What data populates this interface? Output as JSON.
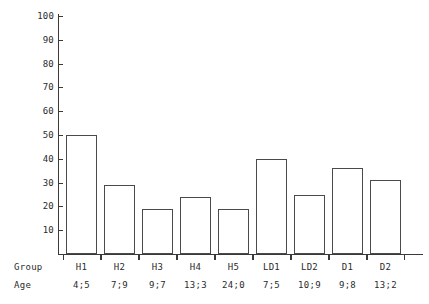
{
  "chart_data": {
    "type": "bar",
    "title": "",
    "subtitle": "",
    "xlabel": "",
    "ylabel": "",
    "categories": [
      "H1",
      "H2",
      "H3",
      "H4",
      "H5",
      "LD1",
      "LD2",
      "D1",
      "D2"
    ],
    "values": [
      50,
      29,
      19,
      24,
      19,
      40,
      25,
      36,
      31
    ],
    "ylim": [
      0,
      100
    ],
    "ytick_labels": [
      "100",
      "90",
      "80",
      "70",
      "60",
      "50",
      "40",
      "30",
      "20",
      "10"
    ],
    "ytick_values": [
      100,
      90,
      80,
      70,
      60,
      50,
      40,
      30,
      20,
      10
    ],
    "grid": false,
    "legend": "none",
    "bar_fill": "#ffffff",
    "bar_edge": "#4a4a4a",
    "axis_color": "#3a3a3a",
    "background": "#ffffff",
    "row_headers": {
      "group": "Group",
      "age": "Age"
    },
    "rows": [
      {
        "group": "H1",
        "age": "4;5",
        "value": 50
      },
      {
        "group": "H2",
        "age": "7;9",
        "value": 29
      },
      {
        "group": "H3",
        "age": "9;7",
        "value": 19
      },
      {
        "group": "H4",
        "age": "13;3",
        "value": 24
      },
      {
        "group": "H5",
        "age": "24;0",
        "value": 19
      },
      {
        "group": "LD1",
        "age": "7;5",
        "value": 40
      },
      {
        "group": "LD2",
        "age": "10;9",
        "value": 25
      },
      {
        "group": "D1",
        "age": "9;8",
        "value": 36
      },
      {
        "group": "D2",
        "age": "13;2",
        "value": 31
      }
    ]
  }
}
